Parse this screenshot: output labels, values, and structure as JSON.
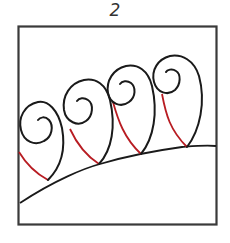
{
  "figure": {
    "label": "2",
    "colors": {
      "outline": "#1a1a1a",
      "border": "#3a3a3a",
      "travel_path": "#b81c22",
      "background": "#ffffff"
    },
    "elements": {
      "border": "square frame",
      "baseline": "curved line rising left to right",
      "curls": [
        "curl-1",
        "curl-2",
        "curl-3",
        "curl-4"
      ],
      "travel_paths": [
        "red-path-1",
        "red-path-2",
        "red-path-3",
        "red-path-4"
      ]
    }
  }
}
